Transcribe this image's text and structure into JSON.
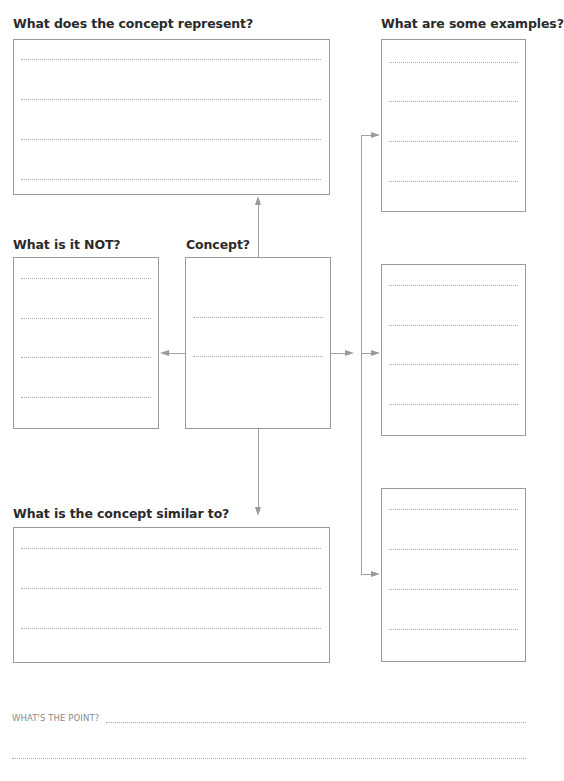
{
  "worksheet": {
    "boxes": {
      "represent": {
        "label": "What does the concept represent?",
        "lines": 4
      },
      "examples": {
        "label": "What are some examples?",
        "lines": 4
      },
      "not": {
        "label": "What is it NOT?",
        "lines": 4
      },
      "concept": {
        "label": "Concept?",
        "lines": 2
      },
      "example2": {
        "label": "",
        "lines": 4
      },
      "similar": {
        "label": "What is the concept similar to?",
        "lines": 3
      },
      "example3": {
        "label": "",
        "lines": 4
      }
    },
    "footer": {
      "point_label": "WHAT'S THE POINT?"
    },
    "colors": {
      "border": "#9a9a9a",
      "dotted_line": "#a8a8a8",
      "label_text": "#2a2a2a",
      "footer_text": "#8a8a8a"
    }
  }
}
